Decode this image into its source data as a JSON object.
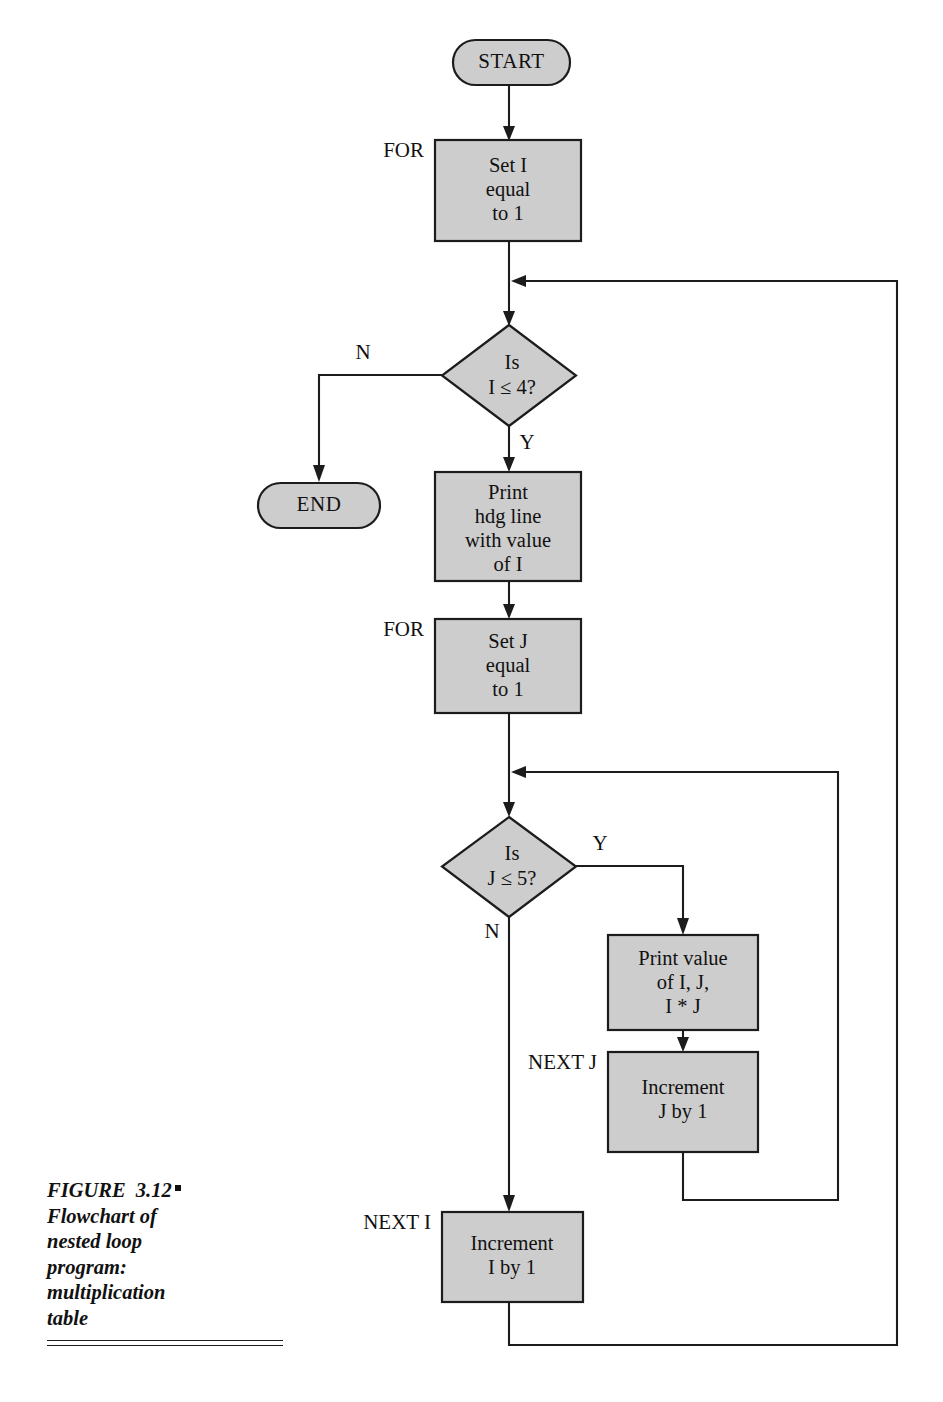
{
  "figure": {
    "caption_label": "FIGURE  3.12",
    "caption_lines": [
      "Flowchart of",
      "nested loop",
      "program:",
      "multiplication",
      "table"
    ]
  },
  "colors": {
    "node_fill": "#cdcdcd",
    "stroke": "#1c1c1c",
    "background": "#ffffff",
    "text": "#111111"
  },
  "nodes": {
    "start": {
      "label": "START",
      "type": "terminator"
    },
    "end": {
      "label": "END",
      "type": "terminator"
    },
    "set_i": {
      "label_lines": [
        "Set I",
        "equal",
        "to 1"
      ],
      "type": "process"
    },
    "decide_i": {
      "label_lines": [
        "Is",
        "I ≤ 4?"
      ],
      "type": "decision"
    },
    "print_hdg": {
      "label_lines": [
        "Print",
        "hdg line",
        "with value",
        "of I"
      ],
      "type": "process"
    },
    "set_j": {
      "label_lines": [
        "Set J",
        "equal",
        "to 1"
      ],
      "type": "process"
    },
    "decide_j": {
      "label_lines": [
        "Is",
        "J ≤ 5?"
      ],
      "type": "decision"
    },
    "print_value": {
      "label_lines": [
        "Print value",
        "of I, J,",
        "I * J"
      ],
      "type": "process"
    },
    "increment_j": {
      "label_lines": [
        "Increment",
        "J by 1"
      ],
      "type": "process"
    },
    "increment_i": {
      "label_lines": [
        "Increment",
        "I by 1"
      ],
      "type": "process"
    }
  },
  "edge_labels": {
    "decide_i_no": "N",
    "decide_i_yes": "Y",
    "decide_j_yes": "Y",
    "decide_j_no": "N"
  },
  "side_labels": {
    "for_i": "FOR",
    "for_j": "FOR",
    "next_j": "NEXT J",
    "next_i": "NEXT I"
  }
}
